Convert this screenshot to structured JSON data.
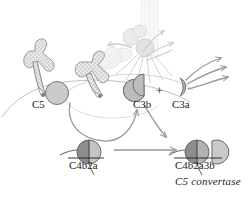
{
  "diagram": {
    "labels": {
      "c3": "C5",
      "c3b": "C3b",
      "c3a": "C3a",
      "plus": "+",
      "c4b2a": "C4b2a",
      "c4b2a3b": "C4b2a3b",
      "convertase": "C5 convertase"
    },
    "colors": {
      "dark_gray": "#8d8d8d",
      "mid_gray": "#b9b9b9",
      "light_gray": "#cfcfcf",
      "pale_gray": "#e3e3e3",
      "outline": "#6f6f6f",
      "faint_outline": "#c9c9c9",
      "text": "#231f20",
      "arrow": "#9a9a9a",
      "background": "#ffffff"
    },
    "elements": [
      {
        "name": "antibody-left",
        "kind": "stippled-y-shape"
      },
      {
        "name": "antibody-right",
        "kind": "stippled-y-shape"
      },
      {
        "name": "membrane-curve",
        "kind": "cell-surface-line"
      },
      {
        "name": "c5-sphere",
        "kind": "filled-circle"
      },
      {
        "name": "c3b-half-sphere",
        "kind": "half-circle"
      },
      {
        "name": "c3a-crescent",
        "kind": "thin-crescent"
      },
      {
        "name": "c4b2a-complex",
        "kind": "two-part-circle"
      },
      {
        "name": "c4b2a3b-complex",
        "kind": "three-part-complex"
      },
      {
        "name": "ghost-mac-column",
        "kind": "faded-membrane-pore"
      },
      {
        "name": "curved-arrow-c4b2a-to-c3b",
        "kind": "arrow"
      },
      {
        "name": "curved-arrow-c3b-to-product",
        "kind": "arrow"
      },
      {
        "name": "straight-arrow-reaction",
        "kind": "arrow"
      },
      {
        "name": "c3a-radiating-arrows",
        "kind": "arrow-group",
        "count": 3
      },
      {
        "name": "ghost-radiating-arrows",
        "kind": "arrow-group",
        "count": 4
      }
    ]
  }
}
